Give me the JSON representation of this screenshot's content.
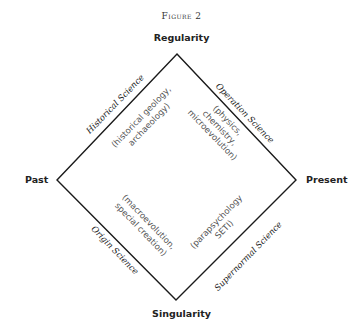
{
  "figure": {
    "title": "Figure 2"
  },
  "axes": {
    "top": "Regularity",
    "bottom": "Singularity",
    "left": "Past",
    "right": "Present"
  },
  "quadrants": {
    "upper_left": {
      "title": "Historical Science",
      "examples_line1": "(historical geology,",
      "examples_line2": "archaeology)"
    },
    "upper_right": {
      "title": "Operation Science",
      "examples_line1": "(physics,",
      "examples_line2": "chemistry,",
      "examples_line3": "microevolution)"
    },
    "lower_left": {
      "title": "Origin Science",
      "examples_line1": "(macroevolution,",
      "examples_line2": "special creation)"
    },
    "lower_right": {
      "title": "Supernormal Science",
      "examples_line1": "(parapsychology",
      "examples_line2": "SETI)"
    }
  },
  "diamond": {
    "stroke_color": "#1a1a1a",
    "vertices": {
      "top": [
        177,
        54
      ],
      "left": [
        57,
        180
      ],
      "right": [
        296,
        180
      ],
      "bottom": [
        176,
        300
      ]
    }
  }
}
